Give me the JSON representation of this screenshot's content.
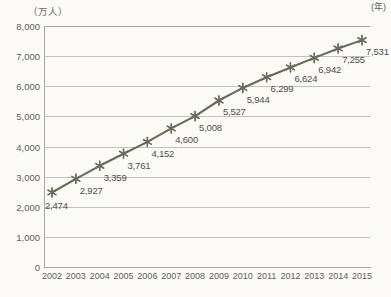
{
  "chart_data": {
    "type": "line",
    "title": "",
    "subtitle": "",
    "xlabel": "(年)",
    "ylabel": "(万人)",
    "unit_label": "（万人）",
    "x_unit_label": "(年)",
    "categories": [
      "2002",
      "2003",
      "2004",
      "2005",
      "2006",
      "2007",
      "2008",
      "2009",
      "2010",
      "2011",
      "2012",
      "2013",
      "2014",
      "2015"
    ],
    "values": [
      2474,
      2927,
      3359,
      3761,
      4152,
      4600,
      5008,
      5527,
      5944,
      6299,
      6624,
      6942,
      7255,
      7531
    ],
    "point_labels": [
      "2,474",
      "2,927",
      "3,359",
      "3,761",
      "4,152",
      "4,600",
      "5,008",
      "5,527",
      "5,944",
      "6,299",
      "6,624",
      "6,942",
      "7,255",
      "7,531"
    ],
    "series": [
      {
        "name": "",
        "values": [
          2474,
          2927,
          3359,
          3761,
          4152,
          4600,
          5008,
          5527,
          5944,
          6299,
          6624,
          6942,
          7255,
          7531
        ]
      }
    ],
    "ylim": [
      0,
      8000
    ],
    "y_ticks": [
      0,
      1000,
      2000,
      3000,
      4000,
      5000,
      6000,
      7000,
      8000
    ],
    "y_tick_labels": [
      "0",
      "1,000",
      "2,000",
      "3,000",
      "4,000",
      "5,000",
      "6,000",
      "7,000",
      "8,000"
    ],
    "grid": true,
    "grid_axis": "y",
    "legend": false,
    "legend_position": "none",
    "marker": "asterisk",
    "line_color": "#6b6a5c",
    "marker_color": "#6b6a5c",
    "grid_color": "#c3c1b9",
    "axis_color": "#a9a79f",
    "text_color": "#5f5e59",
    "background_color": "#fbfaf7"
  }
}
